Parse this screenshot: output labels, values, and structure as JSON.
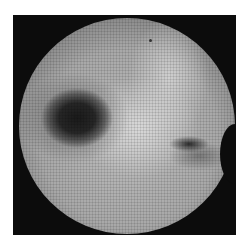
{
  "image": {
    "description": "Grayscale fiberscope endoscopic view with honeycomb fiber pattern inside a black square frame",
    "background_color": "#ffffff",
    "frame_color": "#0c0c0c",
    "features": [
      {
        "name": "dark-cavity-left",
        "tone": "dark"
      },
      {
        "name": "slit-opening-right",
        "tone": "dark"
      },
      {
        "name": "bright-ridge-center",
        "tone": "light"
      }
    ]
  }
}
